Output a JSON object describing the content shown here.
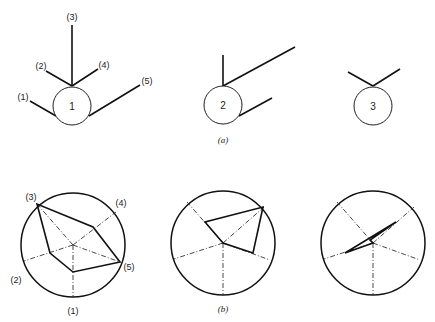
{
  "figure": {
    "panel_a": {
      "caption": "(a)",
      "glyphs": [
        {
          "id": "1",
          "label": "1",
          "rays": [
            "(1)",
            "(2)",
            "(3)",
            "(4)",
            "(5)"
          ]
        },
        {
          "id": "2",
          "label": "2"
        },
        {
          "id": "3",
          "label": "3"
        }
      ],
      "variable_labels": [
        "(1)",
        "(2)",
        "(3)",
        "(4)",
        "(5)"
      ]
    },
    "panel_b": {
      "caption": "(b)",
      "axis_labels": [
        "(1)",
        "(2)",
        "(3)",
        "(4)",
        "(5)"
      ]
    }
  }
}
